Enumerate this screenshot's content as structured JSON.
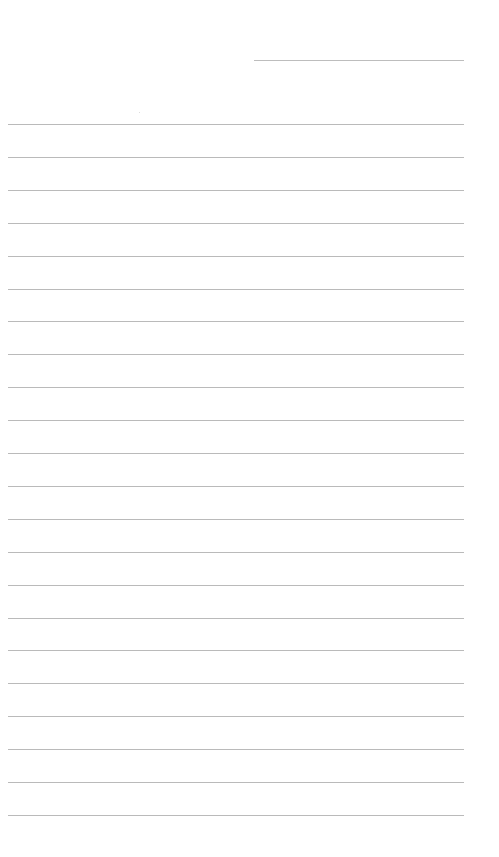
{
  "page": {
    "type": "blank ruled note paper",
    "background_color": "#ffffff",
    "line_color": "#bababa"
  },
  "date_line": {
    "label": "",
    "x": 254,
    "y": 60,
    "width": 210
  },
  "rules": {
    "count": 22,
    "first_y": 124,
    "spacing": 32.9,
    "x": 8,
    "width": 456,
    "lines": [
      "",
      "",
      "",
      "",
      "",
      "",
      "",
      "",
      "",
      "",
      "",
      "",
      "",
      "",
      "",
      "",
      "",
      "",
      "",
      "",
      "",
      ""
    ]
  }
}
